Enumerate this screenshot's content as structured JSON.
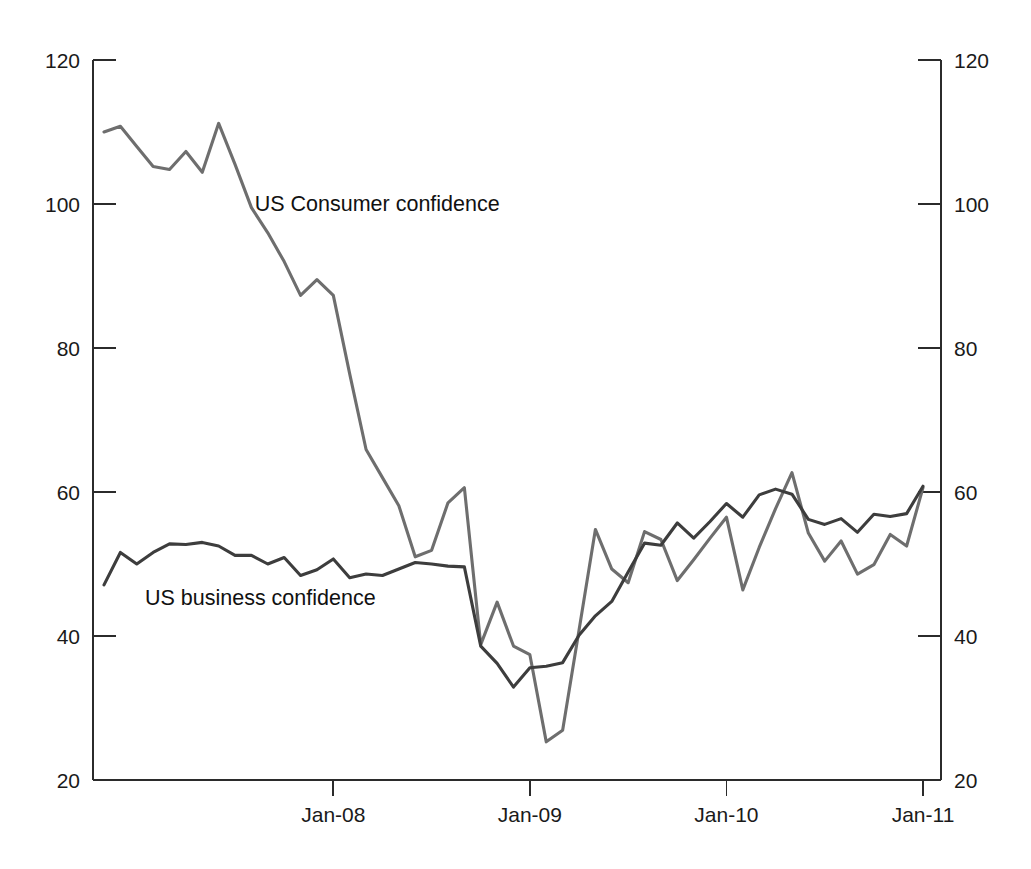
{
  "chart_data": {
    "type": "line",
    "title": "",
    "subtitle": "",
    "xlabel": "",
    "ylabel": "",
    "ylim": [
      20,
      120
    ],
    "y_ticks": [
      20,
      40,
      60,
      80,
      100,
      120
    ],
    "y_tick_labels": [
      "20",
      "40",
      "60",
      "80",
      "100",
      "120"
    ],
    "right_axis": true,
    "right_y_ticks": [
      20,
      40,
      60,
      80,
      100,
      120
    ],
    "right_y_tick_labels": [
      "20",
      "40",
      "60",
      "80",
      "100",
      "120"
    ],
    "x_ticks": [
      "Jan-08",
      "Jan-09",
      "Jan-10",
      "Jan-11"
    ],
    "x_tick_labels": [
      "Jan-08",
      "Jan-09",
      "Jan-10",
      "Jan-11"
    ],
    "x_range": [
      "Nov-06",
      "Jan-11"
    ],
    "grid": false,
    "legend": "inline-annotations",
    "annotations": [
      {
        "text": "US Consumer confidence",
        "x_month": 9.2,
        "value": 99.0
      },
      {
        "text": "US business confidence",
        "x_month": 2.5,
        "value": 44.3
      }
    ],
    "colors": {
      "consumer": "#6e6e6e",
      "business": "#3d3d3d",
      "axis": "#2b2b2b",
      "text": "#111111",
      "background": "#ffffff"
    },
    "series": [
      {
        "name": "US Consumer confidence",
        "color": "#6e6e6e",
        "axis": "left",
        "x": [
          "Nov-06",
          "Dec-06",
          "Jan-07",
          "Feb-07",
          "Mar-07",
          "Apr-07",
          "May-07",
          "Jun-07",
          "Jul-07",
          "Aug-07",
          "Sep-07",
          "Oct-07",
          "Nov-07",
          "Dec-07",
          "Jan-08",
          "Feb-08",
          "Mar-08",
          "Apr-08",
          "May-08",
          "Jun-08",
          "Jul-08",
          "Aug-08",
          "Sep-08",
          "Oct-08",
          "Nov-08",
          "Dec-08",
          "Jan-09",
          "Feb-09",
          "Mar-09",
          "Apr-09",
          "May-09",
          "Jun-09",
          "Jul-09",
          "Aug-09",
          "Sep-09",
          "Oct-09",
          "Nov-09",
          "Dec-09",
          "Jan-10",
          "Feb-10",
          "Mar-10",
          "Apr-10",
          "May-10",
          "Jun-10",
          "Jul-10",
          "Aug-10",
          "Sep-10",
          "Oct-10",
          "Nov-10",
          "Dec-10",
          "Jan-11"
        ],
        "values": [
          110.0,
          110.8,
          108.0,
          105.2,
          104.8,
          107.3,
          104.4,
          111.2,
          105.5,
          99.5,
          96.0,
          92.0,
          87.3,
          89.5,
          87.3,
          76.4,
          65.9,
          62.0,
          58.1,
          51.0,
          51.9,
          58.5,
          60.6,
          38.8,
          44.7,
          38.6,
          37.4,
          25.3,
          26.9,
          40.8,
          54.8,
          49.3,
          47.4,
          54.5,
          53.4,
          47.7,
          50.6,
          53.6,
          56.5,
          46.4,
          52.3,
          57.7,
          62.7,
          54.3,
          50.4,
          53.2,
          48.6,
          49.9,
          54.1,
          52.5,
          60.6
        ]
      },
      {
        "name": "US business confidence",
        "color": "#3d3d3d",
        "axis": "left",
        "x": [
          "Nov-06",
          "Dec-06",
          "Jan-07",
          "Feb-07",
          "Mar-07",
          "Apr-07",
          "May-07",
          "Jun-07",
          "Jul-07",
          "Aug-07",
          "Sep-07",
          "Oct-07",
          "Nov-07",
          "Dec-07",
          "Jan-08",
          "Feb-08",
          "Mar-08",
          "Apr-08",
          "May-08",
          "Jun-08",
          "Jul-08",
          "Aug-08",
          "Sep-08",
          "Oct-08",
          "Nov-08",
          "Dec-08",
          "Jan-09",
          "Feb-09",
          "Mar-09",
          "Apr-09",
          "May-09",
          "Jun-09",
          "Jul-09",
          "Aug-09",
          "Sep-09",
          "Oct-09",
          "Nov-09",
          "Dec-09",
          "Jan-10",
          "Feb-10",
          "Mar-10",
          "Apr-10",
          "May-10",
          "Jun-10",
          "Jul-10",
          "Aug-10",
          "Sep-10",
          "Oct-10",
          "Nov-10",
          "Dec-10",
          "Jan-11"
        ],
        "values": [
          47.1,
          51.6,
          50.0,
          51.6,
          52.8,
          52.7,
          53.0,
          52.5,
          51.2,
          51.2,
          50.0,
          50.9,
          48.4,
          49.2,
          50.7,
          48.1,
          48.6,
          48.4,
          49.3,
          50.2,
          50.0,
          49.7,
          49.6,
          38.6,
          36.2,
          32.9,
          35.6,
          35.8,
          36.3,
          40.1,
          42.8,
          44.8,
          48.9,
          52.9,
          52.6,
          55.7,
          53.6,
          55.9,
          58.4,
          56.5,
          59.6,
          60.4,
          59.7,
          56.2,
          55.5,
          56.3,
          54.4,
          56.9,
          56.6,
          57.0,
          60.8
        ]
      }
    ]
  },
  "axes": {
    "left_ticks": [
      "120",
      "100",
      "80",
      "60",
      "40",
      "20"
    ],
    "right_ticks": [
      "120",
      "100",
      "80",
      "60",
      "40",
      "20"
    ],
    "bottom_ticks": [
      "Jan-08",
      "Jan-09",
      "Jan-10",
      "Jan-11"
    ]
  },
  "annotations": {
    "consumer_label": "US Consumer confidence",
    "business_label": "US business confidence"
  }
}
